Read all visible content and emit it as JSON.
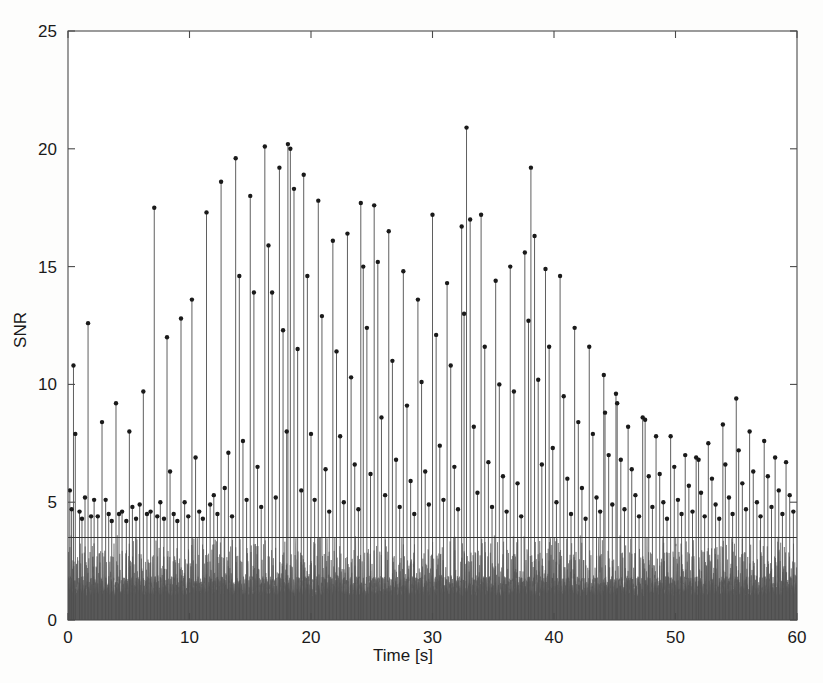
{
  "chart_data": {
    "type": "line",
    "title": "",
    "xlabel": "Time [s]",
    "ylabel": "SNR",
    "xlim": [
      0,
      60
    ],
    "ylim": [
      0,
      25
    ],
    "xticks": [
      0,
      10,
      20,
      30,
      40,
      50,
      60
    ],
    "yticks": [
      0,
      5,
      10,
      15,
      20,
      25
    ],
    "xtick_labels": [
      "0",
      "10",
      "20",
      "30",
      "40",
      "50",
      "60"
    ],
    "ytick_labels": [
      "0",
      "5",
      "10",
      "15",
      "20",
      "25"
    ],
    "grid": false,
    "legend": "none",
    "box": true,
    "tick_direction": "in",
    "background": "#ffffff",
    "series": [
      {
        "name": "noise-floor",
        "type": "area",
        "color": "#595959",
        "description": "Dense continuous noise signal filling the region below SNR 3.6, with solid body up to about SNR 1.85 and rapid spikes reaching up to about SNR 3.6",
        "band_solid_top": 1.85,
        "band_spike_top": 3.6,
        "sample_count": 4200
      },
      {
        "name": "detection-threshold",
        "type": "hline",
        "color": "#333333",
        "value": 3.5,
        "description": "Horizontal constant threshold line spanning the full time axis"
      },
      {
        "name": "detected-peaks",
        "type": "stem",
        "color": "#4d4d4d",
        "marker": "dot",
        "marker_color": "#1a1a1a",
        "marker_size": 3,
        "description": "Stem plot of detected peak SNR values versus time; stems drop to the axis baseline with a dot marker at each peak value. Envelope rises from about 5 at t=0, peaks near t=15-38 with maxima above 20, then decays to about 5-9 after t=45.",
        "points": [
          [
            0.15,
            5.5
          ],
          [
            0.3,
            4.7
          ],
          [
            0.45,
            10.8
          ],
          [
            0.6,
            7.9
          ],
          [
            0.95,
            4.6
          ],
          [
            1.15,
            4.3
          ],
          [
            1.4,
            5.2
          ],
          [
            1.65,
            12.6
          ],
          [
            1.9,
            4.4
          ],
          [
            2.15,
            5.1
          ],
          [
            2.45,
            4.4
          ],
          [
            2.8,
            8.4
          ],
          [
            3.1,
            5.1
          ],
          [
            3.35,
            4.5
          ],
          [
            3.6,
            4.2
          ],
          [
            3.95,
            9.2
          ],
          [
            4.2,
            4.5
          ],
          [
            4.45,
            4.6
          ],
          [
            4.8,
            4.2
          ],
          [
            5.05,
            8.0
          ],
          [
            5.3,
            4.8
          ],
          [
            5.6,
            4.3
          ],
          [
            5.9,
            4.9
          ],
          [
            6.2,
            9.7
          ],
          [
            6.5,
            4.5
          ],
          [
            6.8,
            4.6
          ],
          [
            7.1,
            17.5
          ],
          [
            7.35,
            4.4
          ],
          [
            7.6,
            5.0
          ],
          [
            7.9,
            4.3
          ],
          [
            8.15,
            12.0
          ],
          [
            8.4,
            6.3
          ],
          [
            8.7,
            4.5
          ],
          [
            9.0,
            4.2
          ],
          [
            9.3,
            12.8
          ],
          [
            9.6,
            5.0
          ],
          [
            9.9,
            4.4
          ],
          [
            10.2,
            13.6
          ],
          [
            10.5,
            6.9
          ],
          [
            10.8,
            4.6
          ],
          [
            11.1,
            4.3
          ],
          [
            11.4,
            17.3
          ],
          [
            11.7,
            4.9
          ],
          [
            12.0,
            5.3
          ],
          [
            12.3,
            4.5
          ],
          [
            12.6,
            18.6
          ],
          [
            12.9,
            5.6
          ],
          [
            13.2,
            7.1
          ],
          [
            13.5,
            4.4
          ],
          [
            13.8,
            19.6
          ],
          [
            14.1,
            14.6
          ],
          [
            14.4,
            7.6
          ],
          [
            14.7,
            5.1
          ],
          [
            15.0,
            18.0
          ],
          [
            15.3,
            13.9
          ],
          [
            15.6,
            6.5
          ],
          [
            15.9,
            4.8
          ],
          [
            16.2,
            20.1
          ],
          [
            16.5,
            15.9
          ],
          [
            16.8,
            13.9
          ],
          [
            17.1,
            5.2
          ],
          [
            17.4,
            19.2
          ],
          [
            17.7,
            12.3
          ],
          [
            18.0,
            8.0
          ],
          [
            18.1,
            20.2
          ],
          [
            18.3,
            20.0
          ],
          [
            18.6,
            18.3
          ],
          [
            18.9,
            11.5
          ],
          [
            19.2,
            5.5
          ],
          [
            19.4,
            18.9
          ],
          [
            19.7,
            14.6
          ],
          [
            20.0,
            7.9
          ],
          [
            20.3,
            5.1
          ],
          [
            20.6,
            17.8
          ],
          [
            20.9,
            12.9
          ],
          [
            21.2,
            6.4
          ],
          [
            21.5,
            4.6
          ],
          [
            21.8,
            16.1
          ],
          [
            22.1,
            11.4
          ],
          [
            22.4,
            7.8
          ],
          [
            22.7,
            5.0
          ],
          [
            23.0,
            16.4
          ],
          [
            23.3,
            10.3
          ],
          [
            23.6,
            6.6
          ],
          [
            23.9,
            4.7
          ],
          [
            24.1,
            17.7
          ],
          [
            24.3,
            15.0
          ],
          [
            24.6,
            12.4
          ],
          [
            24.9,
            6.2
          ],
          [
            25.2,
            17.6
          ],
          [
            25.5,
            15.2
          ],
          [
            25.8,
            8.6
          ],
          [
            26.1,
            5.3
          ],
          [
            26.4,
            16.5
          ],
          [
            26.7,
            11.0
          ],
          [
            27.0,
            6.8
          ],
          [
            27.3,
            4.8
          ],
          [
            27.6,
            14.8
          ],
          [
            27.9,
            9.1
          ],
          [
            28.2,
            5.9
          ],
          [
            28.5,
            4.5
          ],
          [
            28.8,
            13.6
          ],
          [
            29.1,
            10.1
          ],
          [
            29.4,
            6.3
          ],
          [
            29.7,
            4.9
          ],
          [
            30.0,
            17.2
          ],
          [
            30.3,
            12.1
          ],
          [
            30.6,
            7.4
          ],
          [
            30.9,
            5.1
          ],
          [
            31.2,
            14.3
          ],
          [
            31.5,
            10.8
          ],
          [
            31.8,
            6.5
          ],
          [
            32.1,
            4.7
          ],
          [
            32.4,
            16.7
          ],
          [
            32.6,
            13.0
          ],
          [
            32.8,
            20.9
          ],
          [
            33.1,
            17.0
          ],
          [
            33.4,
            8.2
          ],
          [
            33.7,
            5.4
          ],
          [
            34.0,
            17.2
          ],
          [
            34.3,
            11.6
          ],
          [
            34.6,
            6.7
          ],
          [
            34.9,
            4.8
          ],
          [
            35.2,
            14.4
          ],
          [
            35.5,
            10.0
          ],
          [
            35.8,
            6.1
          ],
          [
            36.1,
            4.6
          ],
          [
            36.4,
            15.0
          ],
          [
            36.7,
            9.7
          ],
          [
            37.0,
            5.8
          ],
          [
            37.3,
            4.4
          ],
          [
            37.6,
            15.6
          ],
          [
            37.9,
            12.7
          ],
          [
            38.1,
            19.2
          ],
          [
            38.4,
            16.3
          ],
          [
            38.7,
            10.2
          ],
          [
            39.0,
            6.6
          ],
          [
            39.3,
            14.9
          ],
          [
            39.6,
            11.6
          ],
          [
            39.9,
            7.3
          ],
          [
            40.2,
            5.0
          ],
          [
            40.5,
            14.6
          ],
          [
            40.8,
            9.5
          ],
          [
            41.1,
            6.0
          ],
          [
            41.4,
            4.5
          ],
          [
            41.7,
            12.4
          ],
          [
            42.0,
            8.4
          ],
          [
            42.3,
            5.6
          ],
          [
            42.6,
            4.3
          ],
          [
            42.9,
            11.6
          ],
          [
            43.2,
            7.9
          ],
          [
            43.5,
            5.2
          ],
          [
            43.8,
            4.6
          ],
          [
            44.1,
            10.4
          ],
          [
            44.2,
            8.8
          ],
          [
            44.5,
            7.0
          ],
          [
            44.8,
            4.9
          ],
          [
            45.1,
            9.6
          ],
          [
            45.2,
            9.2
          ],
          [
            45.5,
            6.8
          ],
          [
            45.8,
            4.7
          ],
          [
            46.1,
            8.2
          ],
          [
            46.4,
            6.4
          ],
          [
            46.7,
            5.3
          ],
          [
            47.0,
            4.4
          ],
          [
            47.3,
            8.6
          ],
          [
            47.5,
            8.5
          ],
          [
            47.8,
            6.1
          ],
          [
            48.1,
            4.8
          ],
          [
            48.4,
            7.8
          ],
          [
            48.7,
            6.2
          ],
          [
            49.0,
            5.0
          ],
          [
            49.3,
            4.3
          ],
          [
            49.6,
            7.8
          ],
          [
            49.9,
            6.5
          ],
          [
            50.2,
            5.1
          ],
          [
            50.5,
            4.5
          ],
          [
            50.8,
            7.0
          ],
          [
            51.1,
            5.7
          ],
          [
            51.4,
            4.6
          ],
          [
            51.7,
            6.9
          ],
          [
            51.9,
            6.8
          ],
          [
            52.1,
            5.4
          ],
          [
            52.4,
            4.4
          ],
          [
            52.7,
            7.5
          ],
          [
            53.0,
            6.0
          ],
          [
            53.3,
            4.9
          ],
          [
            53.6,
            4.3
          ],
          [
            53.9,
            8.3
          ],
          [
            54.1,
            6.6
          ],
          [
            54.4,
            5.2
          ],
          [
            54.7,
            4.5
          ],
          [
            55.0,
            9.4
          ],
          [
            55.2,
            7.2
          ],
          [
            55.5,
            5.8
          ],
          [
            55.8,
            4.7
          ],
          [
            56.1,
            8.0
          ],
          [
            56.4,
            6.3
          ],
          [
            56.7,
            5.0
          ],
          [
            57.0,
            4.4
          ],
          [
            57.3,
            7.6
          ],
          [
            57.6,
            6.1
          ],
          [
            57.9,
            4.8
          ],
          [
            58.2,
            6.9
          ],
          [
            58.5,
            5.5
          ],
          [
            58.8,
            4.5
          ],
          [
            59.1,
            6.7
          ],
          [
            59.4,
            5.3
          ],
          [
            59.7,
            4.6
          ]
        ]
      }
    ]
  },
  "axes": {
    "ylabel": "SNR",
    "xlabel": "Time [s]"
  }
}
